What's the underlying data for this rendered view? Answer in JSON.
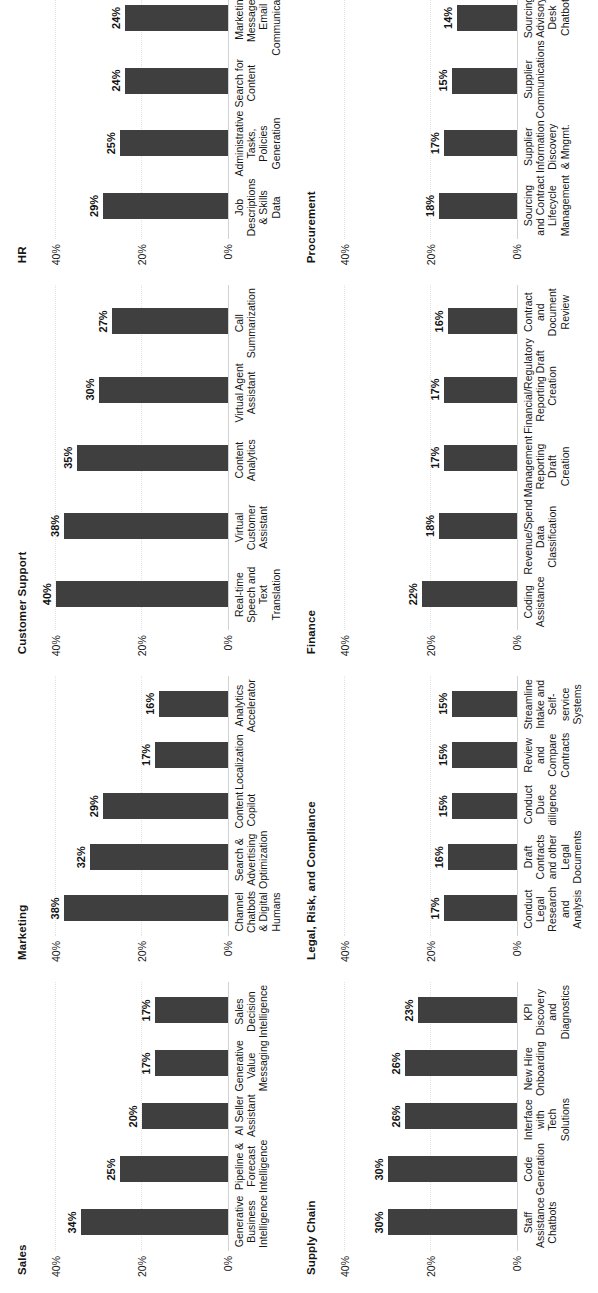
{
  "figure": {
    "background": "#ffffff",
    "bar_color": "#3f3f3f",
    "axis_label_suffix": "%",
    "axis_ticks": [
      "0%",
      "20%",
      "40%"
    ],
    "axis_tick_values": [
      0,
      20,
      40
    ]
  },
  "chart_data": [
    {
      "type": "bar",
      "title": "Sales",
      "xlabel": "",
      "ylabel": "",
      "ylim": [
        0,
        45
      ],
      "grid": true,
      "legend": "none",
      "ticks": [
        "0%",
        "20%",
        "40%"
      ],
      "categories": [
        "Generative Business Intelligence",
        "Pipeline & Forecast Intelligence",
        "AI Seller Assistant",
        "Generative Value Messaging",
        "Sales Decision Intelligence"
      ],
      "values": [
        34,
        25,
        20,
        17,
        17
      ],
      "labels": [
        "34%",
        "25%",
        "20%",
        "17%",
        "17%"
      ]
    },
    {
      "type": "bar",
      "title": "Marketing",
      "xlabel": "",
      "ylabel": "",
      "ylim": [
        0,
        45
      ],
      "grid": true,
      "legend": "none",
      "ticks": [
        "0%",
        "20%",
        "40%"
      ],
      "categories": [
        "Channel Chatbots & Digital Humans",
        "Search & Advertising Optimization",
        "Content Copilot",
        "Localization",
        "Analytics Accelerator"
      ],
      "values": [
        38,
        32,
        29,
        17,
        16
      ],
      "labels": [
        "38%",
        "32%",
        "29%",
        "17%",
        "16%"
      ]
    },
    {
      "type": "bar",
      "title": "Customer Support",
      "xlabel": "",
      "ylabel": "",
      "ylim": [
        0,
        45
      ],
      "grid": true,
      "legend": "none",
      "ticks": [
        "0%",
        "20%",
        "40%"
      ],
      "categories": [
        "Real-time Speech and Text Translation",
        "Virtual Customer Assistant",
        "Content Analytics",
        "Virtual Agent Assistant",
        "Call Summarization"
      ],
      "values": [
        40,
        38,
        35,
        30,
        27
      ],
      "labels": [
        "40%",
        "38%",
        "35%",
        "30%",
        "27%"
      ]
    },
    {
      "type": "bar",
      "title": "HR",
      "xlabel": "",
      "ylabel": "",
      "ylim": [
        0,
        45
      ],
      "grid": true,
      "legend": "none",
      "ticks": [
        "0%",
        "20%",
        "40%"
      ],
      "categories": [
        "Job Descriptions & Skills Data",
        "Administrative Tasks, Policies Generation",
        "Search for Content",
        "Marketing Messages, Email Communications",
        "Employee Facing Chatbot"
      ],
      "values": [
        29,
        25,
        24,
        24,
        23
      ],
      "labels": [
        "29%",
        "25%",
        "24%",
        "24%",
        "23%"
      ]
    },
    {
      "type": "bar",
      "title": "Supply Chain",
      "xlabel": "",
      "ylabel": "",
      "ylim": [
        0,
        45
      ],
      "grid": true,
      "legend": "none",
      "ticks": [
        "0%",
        "20%",
        "40%"
      ],
      "categories": [
        "Staff Assistance Chatbots",
        "Code Generation",
        "Interface with Tech Solutions",
        "New Hire Onboarding",
        "KPI Discovery and Diagnostics"
      ],
      "values": [
        30,
        30,
        26,
        26,
        23
      ],
      "labels": [
        "30%",
        "30%",
        "26%",
        "26%",
        "23%"
      ]
    },
    {
      "type": "bar",
      "title": "Legal, Risk, and Compliance",
      "xlabel": "",
      "ylabel": "",
      "ylim": [
        0,
        45
      ],
      "grid": true,
      "legend": "none",
      "ticks": [
        "0%",
        "20%",
        "40%"
      ],
      "categories": [
        "Conduct Legal Research and Analysis",
        "Draft Contracts and other Legal Documents",
        "Conduct Due diligence",
        "Review and Compare Contracts",
        "Streamline Intake and Self-service Systems"
      ],
      "values": [
        17,
        16,
        15,
        15,
        15
      ],
      "labels": [
        "17%",
        "16%",
        "15%",
        "15%",
        "15%"
      ]
    },
    {
      "type": "bar",
      "title": "Finance",
      "xlabel": "",
      "ylabel": "",
      "ylim": [
        0,
        45
      ],
      "grid": true,
      "legend": "none",
      "ticks": [
        "0%",
        "20%",
        "40%"
      ],
      "categories": [
        "Coding Assistance",
        "Revenue/Spend Data Classification",
        "Management Reporting Draft Creation",
        "Financial/Regulatory Reporting Draft Creation",
        "Contract and Document Review"
      ],
      "values": [
        22,
        18,
        17,
        17,
        16
      ],
      "labels": [
        "22%",
        "18%",
        "17%",
        "17%",
        "16%"
      ]
    },
    {
      "type": "bar",
      "title": "Procurement",
      "xlabel": "",
      "ylabel": "",
      "ylim": [
        0,
        45
      ],
      "grid": true,
      "legend": "none",
      "ticks": [
        "0%",
        "20%",
        "40%"
      ],
      "categories": [
        "Sourcing and Contract Lifecycle Management",
        "Supplier Information Discovery & Mngmt.",
        "Supplier Communications",
        "Sourcing Advisory Desk Chatbot",
        "Summarization of Proposal Reviews"
      ],
      "values": [
        18,
        17,
        15,
        14,
        10
      ],
      "labels": [
        "18%",
        "17%",
        "15%",
        "14%",
        "10%"
      ]
    }
  ]
}
